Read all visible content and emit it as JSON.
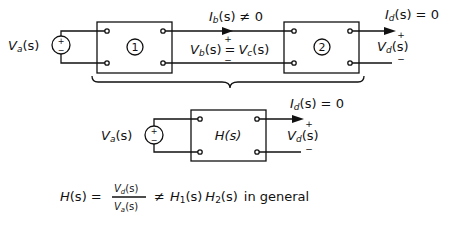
{
  "top_circuit": {
    "source_label": "Va(s)",
    "source_label_main": "V",
    "source_label_sub": "a",
    "source_label_arg": "(s)",
    "block1_label": "1",
    "block2_label": "2",
    "ib_main": "I",
    "ib_sub": "b",
    "ib_rest": "(s) ≠ 0",
    "vb_main": "V",
    "vb_sub": "b",
    "vb_arg": "(s)",
    "eq_sign": "=",
    "vc_main": "V",
    "vc_sub": "c",
    "vc_arg": "(s)",
    "id_main": "I",
    "id_sub": "d",
    "id_rest": "(s) = 0",
    "vd_main": "V",
    "vd_sub": "d",
    "vd_arg": "(s)",
    "plus": "+",
    "minus": "−"
  },
  "bottom_circuit": {
    "source_label_main": "V",
    "source_label_sub": "a",
    "source_label_arg": "(s)",
    "block_label": "H(s)",
    "id_main": "I",
    "id_sub": "d",
    "id_rest": "(s) = 0",
    "vd_main": "V",
    "vd_sub": "d",
    "vd_arg": "(s)",
    "plus": "+",
    "minus": "−"
  },
  "equation": {
    "lhs": "H(s) =",
    "num_main": "V",
    "num_sub": "d",
    "num_arg": "(s)",
    "den_main": "V",
    "den_sub": "a",
    "den_arg": "(s)",
    "neq": "≠",
    "h1_main": "H",
    "h1_sub": "1",
    "h1_arg": "(s)",
    "h2_main": "H",
    "h2_sub": "2",
    "h2_arg": "(s)",
    "suffix": "in general"
  }
}
